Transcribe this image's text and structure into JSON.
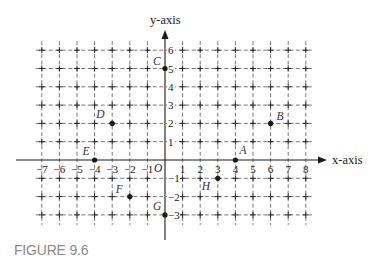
{
  "caption": "FIGURE 9.6",
  "axes": {
    "x_label_var": "x",
    "x_label_rest": "-axis",
    "y_label_var": "y",
    "y_label_rest": "-axis",
    "origin_label": "O"
  },
  "colors": {
    "ink": "#1a1a1a",
    "grid": "#555555",
    "caption": "#8a8a8a"
  },
  "chart_data": {
    "type": "scatter",
    "title": "FIGURE 9.6",
    "xlabel": "x-axis",
    "ylabel": "y-axis",
    "xlim": [
      -7,
      8
    ],
    "ylim": [
      -3,
      6
    ],
    "grid": true,
    "grid_style": "dashed",
    "x_ticks": [
      -7,
      -6,
      -5,
      -4,
      -3,
      -2,
      -1,
      1,
      2,
      3,
      4,
      5,
      6,
      7,
      8
    ],
    "y_ticks": [
      6,
      5,
      4,
      3,
      2,
      1,
      -1,
      -2,
      -3
    ],
    "points": [
      {
        "label": "A",
        "x": 4,
        "y": 0
      },
      {
        "label": "B",
        "x": 6,
        "y": 2
      },
      {
        "label": "C",
        "x": 0,
        "y": 5
      },
      {
        "label": "D",
        "x": -3,
        "y": 2
      },
      {
        "label": "E",
        "x": -4,
        "y": 0
      },
      {
        "label": "F",
        "x": -2,
        "y": -2
      },
      {
        "label": "G",
        "x": 0,
        "y": -3
      },
      {
        "label": "H",
        "x": 3,
        "y": -1
      }
    ]
  },
  "label_offsets": {
    "A": [
      4,
      -6
    ],
    "B": [
      6,
      -3
    ],
    "C": [
      -12,
      -4
    ],
    "D": [
      -16,
      -5
    ],
    "E": [
      -12,
      -5
    ],
    "F": [
      -14,
      -4
    ],
    "G": [
      -12,
      -5
    ],
    "H": [
      -16,
      12
    ]
  }
}
